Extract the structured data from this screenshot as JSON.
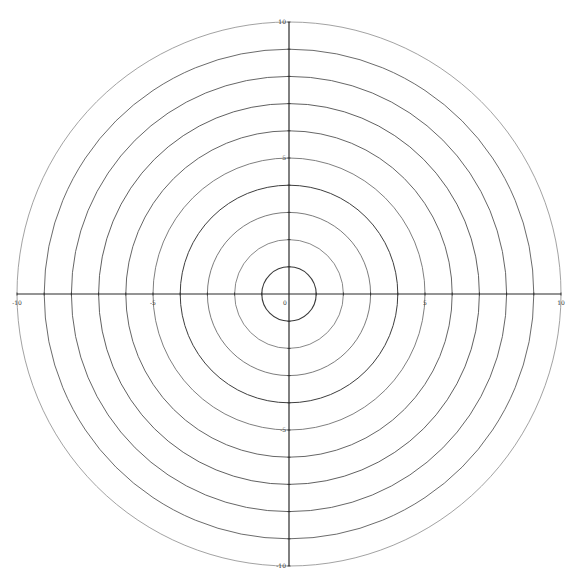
{
  "diagram": {
    "type": "polar-grid",
    "title": "",
    "center": {
      "x": 289,
      "y": 294
    },
    "unit_px": 27.2,
    "rings": [
      1,
      2,
      3,
      4,
      5,
      6,
      7,
      8,
      9,
      10
    ],
    "ring_styles": [
      {
        "r": 1,
        "color": "#3a3a3a",
        "width": 1.1
      },
      {
        "r": 2,
        "color": "#6a6a6a",
        "width": 0.8
      },
      {
        "r": 3,
        "color": "#5a5a5a",
        "width": 0.8
      },
      {
        "r": 4,
        "color": "#3e3e3e",
        "width": 1.0
      },
      {
        "r": 5,
        "color": "#5e5e5e",
        "width": 0.8
      },
      {
        "r": 6,
        "color": "#555555",
        "width": 0.9
      },
      {
        "r": 7,
        "color": "#4e4e4e",
        "width": 0.9
      },
      {
        "r": 8,
        "color": "#555555",
        "width": 0.9
      },
      {
        "r": 9,
        "color": "#5a5a5a",
        "width": 0.9
      },
      {
        "r": 10,
        "color": "#8a8a8a",
        "width": 0.8
      }
    ],
    "axes": {
      "color": "#2a2a2a",
      "range": [
        -10,
        10
      ],
      "x_labels": [
        {
          "value": -10,
          "text": "-10"
        },
        {
          "value": -5,
          "text": "-5"
        },
        {
          "value": 0,
          "text": "0"
        },
        {
          "value": 5,
          "text": "5"
        },
        {
          "value": 10,
          "text": "10"
        }
      ],
      "y_labels": [
        {
          "value": 10,
          "text": "10"
        },
        {
          "value": 5,
          "text": "5"
        },
        {
          "value": -5,
          "text": "-5"
        },
        {
          "value": -10,
          "text": "-10"
        }
      ]
    }
  }
}
